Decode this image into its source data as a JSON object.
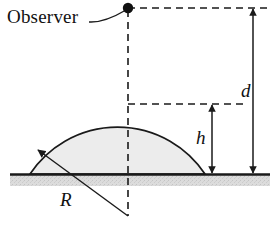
{
  "figure": {
    "labels": {
      "observer": "Observer",
      "distance": "d",
      "height": "h",
      "radius": "R"
    },
    "colors": {
      "stroke": "#1a1a1a",
      "dome_fill": "#ececec",
      "ground_fill": "#d9d9d9",
      "background": "#ffffff"
    }
  },
  "geometry": {
    "observer_point": {
      "x": 128,
      "y": 8
    },
    "dome_apex": {
      "x": 128,
      "y": 103
    },
    "dome_left_base": {
      "x": 30,
      "y": 174
    },
    "dome_right_base": {
      "x": 205,
      "y": 174
    },
    "ground_line_y": 174,
    "ground_strip_height": 11,
    "circle_center": {
      "x": 128,
      "y": 216
    },
    "d_arrow_x": 253,
    "h_arrow_x": 212,
    "center_dashed_x": 128
  }
}
